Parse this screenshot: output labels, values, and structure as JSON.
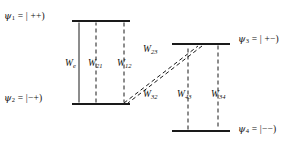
{
  "figure": {
    "type": "energy-level-diagram",
    "background_color": "#ffffff",
    "line_color": "#1a1a1a"
  },
  "states": [
    {
      "id": "psi1",
      "symbol": "ψ",
      "index": "1",
      "equals": "= | ++)",
      "full": "ψ1 = | ++)",
      "level_y": 21,
      "bar_x1": 72,
      "bar_x2": 130
    },
    {
      "id": "psi2",
      "symbol": "ψ",
      "index": "2",
      "equals": "= |−+)",
      "full": "ψ2 = |−+)",
      "level_y": 104,
      "bar_x1": 72,
      "bar_x2": 130
    },
    {
      "id": "psi3",
      "symbol": "ψ",
      "index": "3",
      "equals": "= | +−)",
      "full": "ψ3 = | +−)",
      "level_y": 44,
      "bar_x1": 172,
      "bar_x2": 230
    },
    {
      "id": "psi4",
      "symbol": "ψ",
      "index": "4",
      "equals": "= |−−)",
      "full": "ψ4 = |−−)",
      "level_y": 131,
      "bar_x1": 172,
      "bar_x2": 230
    }
  ],
  "transitions": [
    {
      "id": "we",
      "symbol": "W",
      "sub": "e",
      "full": "We",
      "style": "solid",
      "from": "psi2",
      "to": "psi1",
      "arrows": "both",
      "x": 79
    },
    {
      "id": "w21",
      "symbol": "W",
      "sub": "21",
      "full": "W21",
      "style": "dashed",
      "from": "psi2",
      "to": "psi1",
      "arrows": "up",
      "x": 96
    },
    {
      "id": "w12",
      "symbol": "W",
      "sub": "12",
      "full": "W12",
      "style": "dashed",
      "from": "psi1",
      "to": "psi2",
      "arrows": "down",
      "x": 124
    },
    {
      "id": "w23",
      "symbol": "W",
      "sub": "23",
      "full": "W23",
      "style": "dashed",
      "from": "psi2",
      "to": "psi3",
      "arrows": "up-right"
    },
    {
      "id": "w32",
      "symbol": "W",
      "sub": "32",
      "full": "W32",
      "style": "dashed",
      "from": "psi3",
      "to": "psi2",
      "arrows": "down-left"
    },
    {
      "id": "w43",
      "symbol": "W",
      "sub": "43",
      "full": "W43",
      "style": "dashed",
      "from": "psi4",
      "to": "psi3",
      "arrows": "up",
      "x": 188
    },
    {
      "id": "w34",
      "symbol": "W",
      "sub": "34",
      "full": "W34",
      "style": "dashed",
      "from": "psi3",
      "to": "psi4",
      "arrows": "down",
      "x": 218
    }
  ],
  "labels": {
    "psi1": {
      "sym": "ψ",
      "idx": "1",
      "rest": "= | ++)"
    },
    "psi2": {
      "sym": "ψ",
      "idx": "2",
      "rest": "= |−+)"
    },
    "psi3": {
      "sym": "ψ",
      "idx": "3",
      "rest": "= | +−)"
    },
    "psi4": {
      "sym": "ψ",
      "idx": "4",
      "rest": "= |−−)"
    },
    "we": {
      "sym": "W",
      "sub": "e"
    },
    "w21": {
      "sym": "W",
      "sub": "21"
    },
    "w12": {
      "sym": "W",
      "sub": "12"
    },
    "w23": {
      "sym": "W",
      "sub": "23"
    },
    "w32": {
      "sym": "W",
      "sub": "32"
    },
    "w43": {
      "sym": "W",
      "sub": "43"
    },
    "w34": {
      "sym": "W",
      "sub": "34"
    }
  }
}
